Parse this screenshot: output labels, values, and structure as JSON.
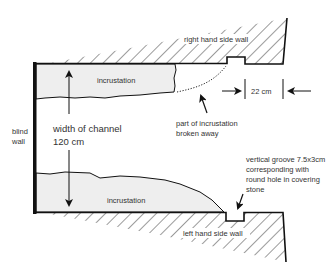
{
  "diagram": {
    "labels": {
      "right_wall": "right hand side wall",
      "left_wall": "left hand side wall",
      "blind_wall_line1": "blind",
      "blind_wall_line2": "wall",
      "incrustation_top": "incrustation",
      "incrustation_bottom": "incrustation",
      "width_line1": "width of channel",
      "width_line2": "120 cm",
      "broken_line1": "part of incrustation",
      "broken_line2": "broken  away",
      "groove_width": "22 cm",
      "groove_note_line1": "vertical groove 7.5x3cm",
      "groove_note_line2": "corresponding with",
      "groove_note_line3": "round hole in covering",
      "groove_note_line4": "stone"
    },
    "colors": {
      "line": "#111111",
      "incrustation_fill": "#eeeeee",
      "text": "#333333"
    }
  }
}
